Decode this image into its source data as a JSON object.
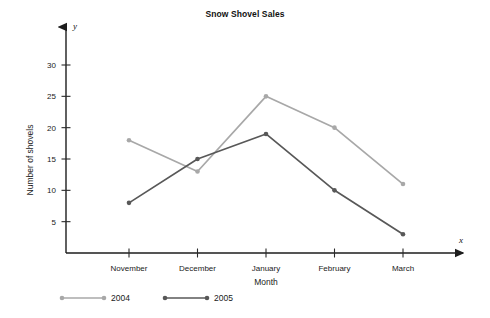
{
  "chart_data": {
    "type": "line",
    "title": "Snow Shovel Sales",
    "xlabel": "Month",
    "ylabel": "Number of shovels",
    "x_axis_symbol": "x",
    "y_axis_symbol": "y",
    "categories": [
      "November",
      "December",
      "January",
      "February",
      "March"
    ],
    "yticks": [
      5,
      10,
      15,
      20,
      25,
      30
    ],
    "ylim": [
      0,
      33
    ],
    "grid": false,
    "legend_position": "bottom-left",
    "series": [
      {
        "name": "2004",
        "color": "#a8a8a8",
        "values": [
          18,
          13,
          25,
          20,
          11
        ]
      },
      {
        "name": "2005",
        "color": "#585858",
        "values": [
          8,
          15,
          19,
          10,
          3
        ]
      }
    ]
  },
  "legend": {
    "items": [
      {
        "label": "2004"
      },
      {
        "label": "2005"
      }
    ]
  }
}
